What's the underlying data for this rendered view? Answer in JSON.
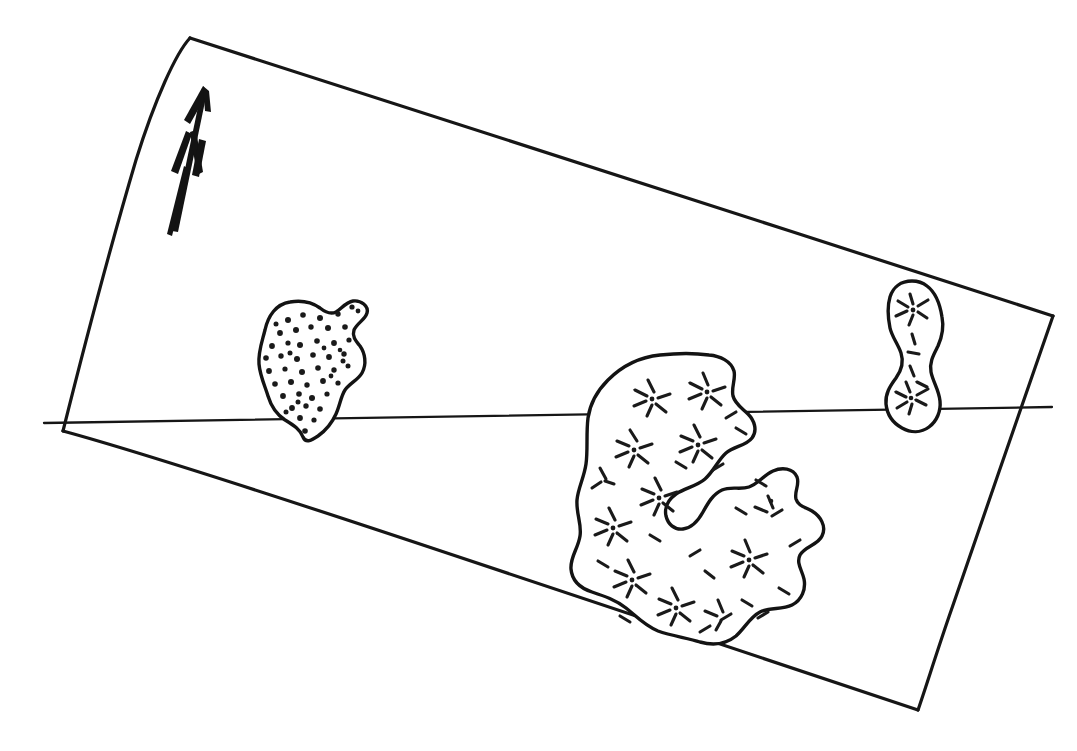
{
  "figure": {
    "kind": "hand-drawn-sketch-map",
    "title": "",
    "background_color": "#ffffff",
    "ink_color": "#161616",
    "width": 1077,
    "height": 751
  },
  "north_arrow": {
    "name": "north-arrow",
    "label": "N",
    "description": "hand-drawn arrow pointing up-left with rotated letter N",
    "rotation_degrees": -16
  },
  "plot_boundary": {
    "name": "plot-boundary",
    "shape": "quadrilateral",
    "corners": [
      {
        "label": "top-left",
        "x": 190,
        "y": 38
      },
      {
        "label": "top-right",
        "x": 1053,
        "y": 316
      },
      {
        "label": "bottom-right",
        "x": 918,
        "y": 710
      },
      {
        "label": "bottom-left",
        "x": 63,
        "y": 431
      }
    ]
  },
  "transect_line": {
    "name": "transect-line",
    "description": "horizontal line crossing the plot",
    "x1": 44,
    "y1": 423,
    "x2": 1052,
    "y2": 407
  },
  "patches": [
    {
      "id": "patch-left",
      "name": "vegetation-patch-left",
      "fill_pattern": "dots",
      "dot_count": 52,
      "approx_bbox": {
        "x": 256,
        "y": 298,
        "width": 116,
        "height": 142
      },
      "crosses_transect": true
    },
    {
      "id": "patch-center",
      "name": "vegetation-patch-center",
      "fill_pattern": "radiating-dashes",
      "star_count": 12,
      "approx_bbox": {
        "x": 575,
        "y": 352,
        "width": 250,
        "height": 290
      },
      "crosses_transect": true
    },
    {
      "id": "patch-right",
      "name": "vegetation-patch-right",
      "fill_pattern": "radiating-dashes",
      "star_count": 3,
      "approx_bbox": {
        "x": 886,
        "y": 279,
        "width": 58,
        "height": 154
      },
      "crosses_transect": true
    }
  ]
}
